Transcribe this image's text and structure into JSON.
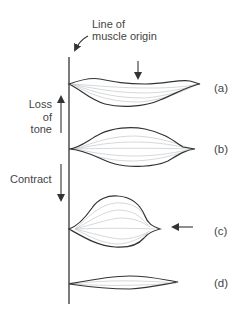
{
  "title": {
    "line1": "Line of",
    "line2": "muscle origin"
  },
  "side_labels": {
    "loss_of_tone": [
      "Loss",
      "of",
      "tone"
    ],
    "contract": "Contract"
  },
  "states": [
    {
      "id": "a",
      "label": "(a)",
      "description": "stretched / loss of tone, bulge below"
    },
    {
      "id": "b",
      "label": "(b)",
      "description": "resting"
    },
    {
      "id": "c",
      "label": "(c)",
      "description": "contracted, shortened and thickened"
    },
    {
      "id": "d",
      "label": "(d)",
      "description": "thin / elongated"
    }
  ],
  "colors": {
    "outline": "#3a3a3a",
    "fibers": "#bfc3c7",
    "text": "#444444"
  }
}
